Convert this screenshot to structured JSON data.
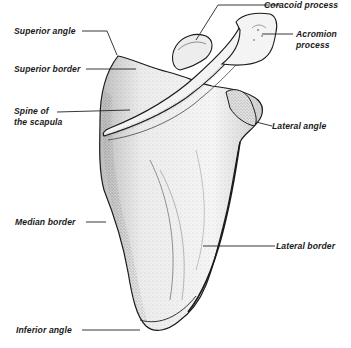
{
  "diagram": {
    "labels": {
      "superior_angle": "Superior angle",
      "superior_border": "Superior border",
      "spine_line1": "Spine of",
      "spine_line2": "the scapula",
      "coracoid": "Coracoid process",
      "acromion_line1": "Acromion",
      "acromion_line2": "process",
      "lateral_angle": "Lateral angle",
      "median_border": "Median border",
      "lateral_border": "Lateral border",
      "inferior_angle": "Inferior angle"
    },
    "colors": {
      "ink": "#1a1a1a",
      "bone_shade": "#cfcfcf",
      "background": "#ffffff"
    }
  }
}
